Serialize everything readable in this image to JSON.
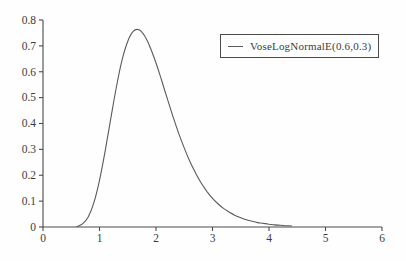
{
  "figure": {
    "background": "#fefefe",
    "ink_color": "#3c3c3c",
    "axis_color": "#4a4a4a",
    "curve_color": "#5a5a5a"
  },
  "chart_data": {
    "type": "line",
    "title": "",
    "xlabel": "",
    "ylabel": "",
    "xlim": [
      0,
      6
    ],
    "ylim": [
      0,
      0.8
    ],
    "x_ticks": [
      "0",
      "1",
      "2",
      "3",
      "4",
      "5",
      "6"
    ],
    "y_ticks": [
      "0",
      "0.1",
      "0.2",
      "0.3",
      "0.4",
      "0.5",
      "0.6",
      "0.7",
      "0.8"
    ],
    "grid": false,
    "legend": {
      "position": "top-right",
      "entries": [
        "VoseLogNormalE(0.6,0.3)"
      ]
    },
    "series": [
      {
        "name": "VoseLogNormalE(0.6,0.3)",
        "peak": {
          "x": 1.7,
          "y": 0.762
        },
        "x": [
          0.6,
          0.7,
          0.8,
          0.9,
          1.0,
          1.1,
          1.2,
          1.3,
          1.4,
          1.5,
          1.6,
          1.7,
          1.8,
          1.9,
          2.0,
          2.1,
          2.2,
          2.3,
          2.4,
          2.5,
          2.6,
          2.7,
          2.8,
          2.9,
          3.0,
          3.1,
          3.2,
          3.3,
          3.4,
          3.5,
          3.6,
          3.7,
          3.8,
          3.9,
          4.0,
          4.1,
          4.2,
          4.3,
          4.4
        ],
        "y": [
          0.002,
          0.012,
          0.039,
          0.093,
          0.18,
          0.294,
          0.42,
          0.543,
          0.646,
          0.718,
          0.757,
          0.762,
          0.738,
          0.693,
          0.634,
          0.566,
          0.496,
          0.428,
          0.363,
          0.305,
          0.253,
          0.209,
          0.17,
          0.138,
          0.111,
          0.089,
          0.071,
          0.057,
          0.045,
          0.036,
          0.028,
          0.022,
          0.017,
          0.014,
          0.011,
          0.008,
          0.007,
          0.005,
          0.004
        ]
      }
    ]
  }
}
